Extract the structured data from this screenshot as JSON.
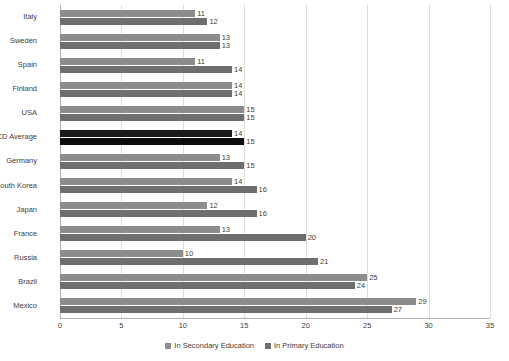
{
  "chart_data": {
    "type": "bar",
    "orientation": "horizontal",
    "title": "",
    "xlabel": "",
    "ylabel": "",
    "xlim": [
      0,
      35
    ],
    "xticks": [
      0,
      5,
      10,
      15,
      20,
      25,
      30,
      35
    ],
    "grid": true,
    "legend_position": "bottom",
    "categories": [
      "Italy",
      "Sweden",
      "Spain",
      "Finland",
      "USA",
      "OECD Average",
      "Germany",
      "South Korea",
      "Japan",
      "France",
      "Russia",
      "Brazil",
      "Mexico"
    ],
    "highlight_category": "OECD Average",
    "series": [
      {
        "name": "In Secondary Education",
        "color": "#8c8c8c",
        "values": [
          11,
          13,
          11,
          14,
          15,
          14,
          13,
          14,
          12,
          13,
          10,
          25,
          29
        ]
      },
      {
        "name": "In Primary Education",
        "color": "#6e6e6e",
        "values": [
          12,
          13,
          14,
          14,
          15,
          15,
          15,
          16,
          16,
          20,
          21,
          24,
          27
        ]
      }
    ]
  },
  "legend": {
    "items": [
      {
        "label": "In Secondary Education",
        "key": "secondary"
      },
      {
        "label": "In Primary Education",
        "key": "primary"
      }
    ]
  },
  "colors": {
    "secondary": "#8c8c8c",
    "primary": "#6e6e6e",
    "highlight_secondary": "#1a1a1a",
    "highlight_primary": "#0d0d0d",
    "gridline": "#dcdcdc",
    "axis": "#b0b0b0",
    "text": "#404040"
  }
}
